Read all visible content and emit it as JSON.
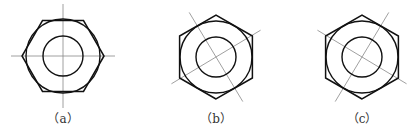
{
  "figures": [
    {
      "id": "a",
      "label": "（a）",
      "center": [
        63,
        56
      ],
      "hex_radius": 41,
      "hex_rotation_deg": 0,
      "outer_circle_r": 37,
      "inner_circle_r": 20,
      "centerline_angles_deg": [
        0,
        90
      ]
    },
    {
      "id": "b",
      "label": "（b）",
      "center": [
        216,
        57
      ],
      "hex_radius": 42,
      "hex_rotation_deg": 90,
      "outer_circle_r": 36,
      "inner_circle_r": 20,
      "centerline_angles_deg": [
        -31,
        59
      ]
    },
    {
      "id": "c",
      "label": "（c）",
      "center": [
        362,
        57
      ],
      "hex_radius": 42,
      "hex_rotation_deg": 90,
      "outer_circle_r": 36,
      "inner_circle_r": 20,
      "centerline_angles_deg": [
        31,
        -59
      ]
    }
  ],
  "colors": {
    "stroke": "#111111",
    "centerline": "#888888"
  }
}
